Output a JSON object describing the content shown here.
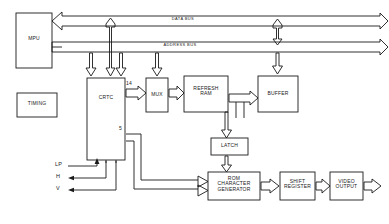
{
  "diagram": {
    "stroke_color": "#1a1a1a",
    "background": "#ffffff",
    "blocks": [
      {
        "id": "mpu",
        "label": "MPU",
        "x": 16,
        "y": 13,
        "w": 36,
        "h": 55
      },
      {
        "id": "timing",
        "label": "TIMING",
        "x": 17,
        "y": 93,
        "w": 40,
        "h": 24
      },
      {
        "id": "crtc",
        "label": "CRTC",
        "x": 87,
        "y": 78,
        "w": 38,
        "h": 82
      },
      {
        "id": "mux",
        "label": "MUX",
        "x": 146,
        "y": 78,
        "w": 22,
        "h": 34
      },
      {
        "id": "refresh",
        "label": "REFRESH\nRAM",
        "x": 184,
        "y": 76,
        "w": 44,
        "h": 36
      },
      {
        "id": "buffer",
        "label": "BUFFER",
        "x": 258,
        "y": 76,
        "w": 40,
        "h": 36
      },
      {
        "id": "latch",
        "label": "LATCH",
        "x": 211,
        "y": 138,
        "w": 37,
        "h": 17
      },
      {
        "id": "romchar",
        "label": "ROM\nCHARACTER\nGENERATOR",
        "x": 208,
        "y": 172,
        "w": 52,
        "h": 28
      },
      {
        "id": "shiftreg",
        "label": "SHIFT\nREGISTER",
        "x": 280,
        "y": 172,
        "w": 35,
        "h": 28
      },
      {
        "id": "videoout",
        "label": "VIDEO\nOUTPUT",
        "x": 330,
        "y": 172,
        "w": 33,
        "h": 28
      }
    ],
    "bus_labels": [
      {
        "id": "data-bus",
        "label": "DATA BUS",
        "x": 158,
        "y": 19
      },
      {
        "id": "address-bus",
        "label": "ADDRESS BUS",
        "x": 150,
        "y": 45
      }
    ],
    "signal_labels": [
      {
        "id": "lp",
        "label": "LP",
        "x": 57,
        "y": 163
      },
      {
        "id": "h",
        "label": "H",
        "x": 58,
        "y": 175
      },
      {
        "id": "v",
        "label": "V",
        "x": 58,
        "y": 187
      }
    ],
    "bit_width_labels": [
      {
        "id": "crtc-mux-width",
        "label": "14",
        "x": 130,
        "y": 83
      },
      {
        "id": "crtc-rom-width",
        "label": "5",
        "x": 121,
        "y": 127
      }
    ]
  }
}
